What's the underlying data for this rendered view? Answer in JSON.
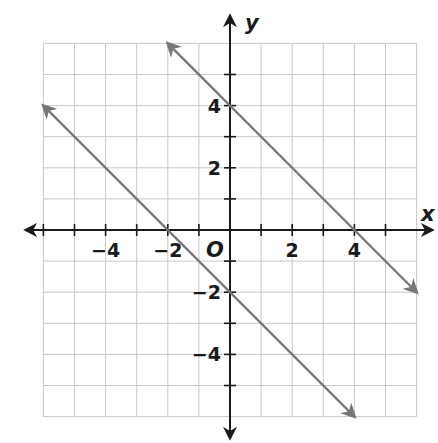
{
  "chart_data": {
    "type": "line",
    "title": "",
    "xlabel": "x",
    "ylabel": "y",
    "origin_label": "O",
    "xlim": [
      -6,
      6
    ],
    "ylim": [
      -6,
      6
    ],
    "grid": true,
    "x_ticks": [
      -6,
      -5,
      -4,
      -3,
      -2,
      -1,
      1,
      2,
      3,
      4,
      5
    ],
    "y_ticks": [
      -5,
      -4,
      -3,
      -2,
      -1,
      1,
      2,
      3,
      4,
      5
    ],
    "x_tick_labels": [
      {
        "value": -4,
        "text": "−4"
      },
      {
        "value": -2,
        "text": "−2"
      },
      {
        "value": 2,
        "text": "2"
      },
      {
        "value": 4,
        "text": "4"
      }
    ],
    "y_tick_labels": [
      {
        "value": 4,
        "text": "4"
      },
      {
        "value": 2,
        "text": "2"
      },
      {
        "value": -2,
        "text": "−2"
      },
      {
        "value": -4,
        "text": "−4"
      }
    ],
    "series": [
      {
        "name": "y = -x + 4",
        "color": "#777777",
        "points": [
          [
            -2,
            6
          ],
          [
            6,
            -2
          ]
        ],
        "arrows": "both"
      },
      {
        "name": "y = -x - 2",
        "color": "#777777",
        "points": [
          [
            -6,
            4
          ],
          [
            4,
            -6
          ]
        ],
        "arrows": "both"
      }
    ],
    "colors": {
      "grid": "#c8c8c8",
      "axis": "#1a1a1a",
      "line": "#777777"
    }
  }
}
